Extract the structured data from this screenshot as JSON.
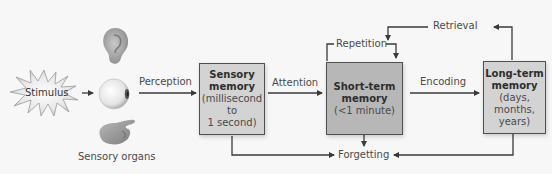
{
  "diagram": {
    "stimulus": {
      "label": "Stimulus",
      "icon": "starburst-icon"
    },
    "sensory_organs": {
      "label": "Sensory organs",
      "icons": [
        "ear-icon",
        "eye-icon",
        "hand-icon"
      ]
    },
    "boxes": {
      "sensory": {
        "title_line1": "Sensory",
        "title_line2": "memory",
        "sub_line1": "(millisecond",
        "sub_line2": "to",
        "sub_line3": "1 second)",
        "fill": "#d3d3d3"
      },
      "short_term": {
        "title_line1": "Short-term",
        "title_line2": "memory",
        "sub_line1": "(<1 minute)",
        "fill": "#b7b7b7"
      },
      "long_term": {
        "title_line1": "Long-term",
        "title_line2": "memory",
        "sub_line1": "(days,",
        "sub_line2": "months,",
        "sub_line3": "years)",
        "fill": "#d3d3d3"
      }
    },
    "arrows": {
      "perception": "Perception",
      "attention": "Attention",
      "encoding": "Encoding",
      "repetition": "Repetition",
      "retrieval": "Retrieval",
      "forgetting": "Forgetting"
    },
    "colors": {
      "line": "#3a3a3a",
      "background": "#f7f7f7"
    }
  }
}
